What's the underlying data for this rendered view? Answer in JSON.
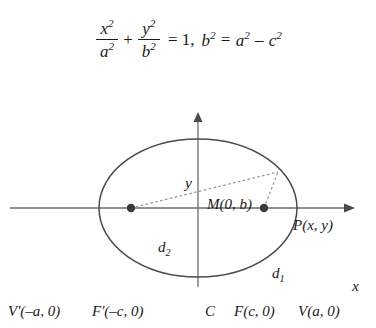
{
  "equation": {
    "term1": {
      "numerator": "x",
      "numerator_exp": "2",
      "denominator": "a",
      "denominator_exp": "2"
    },
    "plus": "+",
    "term2": {
      "numerator": "y",
      "numerator_exp": "2",
      "denominator": "b",
      "denominator_exp": "2"
    },
    "equals": "= 1,",
    "relation": "b² = a² – c²",
    "relation_parts": {
      "b": "b",
      "b_exp": "2",
      "eq": "=",
      "a": "a",
      "a_exp": "2",
      "minus": "–",
      "c": "c",
      "c_exp": "2"
    },
    "full_text": "x²/a² + y²/b² = 1, b² = a² – c²"
  },
  "figure": {
    "axes": {
      "x_label": "x",
      "y_label": "y"
    },
    "labels": {
      "top_vertex": "M(0, b)",
      "bottom_vertex": "M'(0, –b)",
      "left_vertex": "V'(–a, 0)",
      "right_vertex": "V(a, 0)",
      "left_focus": "F'(–c, 0)",
      "right_focus": "F(c, 0)",
      "center": "C",
      "point_p": "P(x, y)",
      "focal_radius_1": "d",
      "focal_radius_1_sub": "1",
      "focal_radius_2": "d",
      "focal_radius_2_sub": "2"
    },
    "geometry": {
      "center_x": 198,
      "center_y": 126,
      "semi_major_a": 99,
      "semi_minor_b": 69,
      "focus_offset_c": 67,
      "point_p_x": 278,
      "point_p_y": 90
    },
    "colors": {
      "curve": "#4a4a4a",
      "axis": "#6b6b6b",
      "dashed": "#8a8a8a",
      "dot": "#3a3a3a",
      "text": "#1a1a1a",
      "background": "#ffffff"
    }
  }
}
